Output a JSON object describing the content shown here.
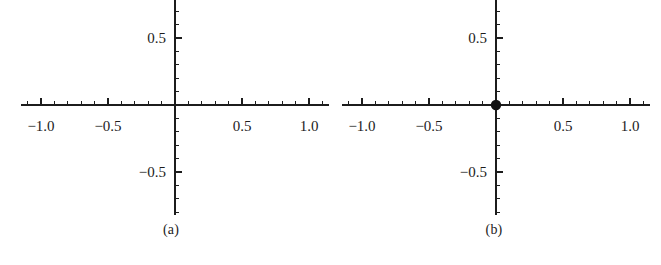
{
  "figure": {
    "panels": [
      {
        "id": "a",
        "caption": "(a)",
        "chart_data": {
          "type": "scatter",
          "title": "",
          "xlabel": "",
          "ylabel": "",
          "xlim": [
            -1.15,
            1.15
          ],
          "ylim": [
            -1.15,
            1.15
          ],
          "grid": false,
          "legend": "none",
          "xticks": [
            -1.0,
            -0.5,
            0.5,
            1.0
          ],
          "xticklabels": [
            "-1.0",
            "-0.5",
            "0.5",
            "1.0"
          ],
          "yticks": [
            -1.0,
            -0.5,
            0.5,
            1.0
          ],
          "yticklabels": [
            "-1.0",
            "-0.5",
            "0.5",
            "1.0"
          ],
          "minor_tick_step": 0.1,
          "major_tick_step": 0.5,
          "series": [
            {
              "name": "points",
              "marker": "filled-circle",
              "color": "#111111",
              "x": [
                -1.0,
                1.0,
                -1.0,
                1.0
              ],
              "y": [
                1.0,
                1.0,
                -1.0,
                -1.0
              ]
            }
          ]
        }
      },
      {
        "id": "b",
        "caption": "(b)",
        "chart_data": {
          "type": "scatter",
          "title": "",
          "xlabel": "",
          "ylabel": "",
          "xlim": [
            -1.15,
            1.15
          ],
          "ylim": [
            -1.15,
            1.15
          ],
          "grid": false,
          "legend": "none",
          "xticks": [
            -1.0,
            -0.5,
            0.5,
            1.0
          ],
          "xticklabels": [
            "-1.0",
            "-0.5",
            "0.5",
            "1.0"
          ],
          "yticks": [
            -1.0,
            -0.5,
            0.5,
            1.0
          ],
          "yticklabels": [
            "-1.0",
            "-0.5",
            "0.5",
            "1.0"
          ],
          "minor_tick_step": 0.1,
          "major_tick_step": 0.5,
          "series": [
            {
              "name": "points",
              "marker": "filled-circle",
              "color": "#111111",
              "x": [
                -1.0,
                0.0,
                1.0
              ],
              "y": [
                -1.0,
                0.0,
                1.0
              ]
            }
          ]
        }
      }
    ]
  }
}
